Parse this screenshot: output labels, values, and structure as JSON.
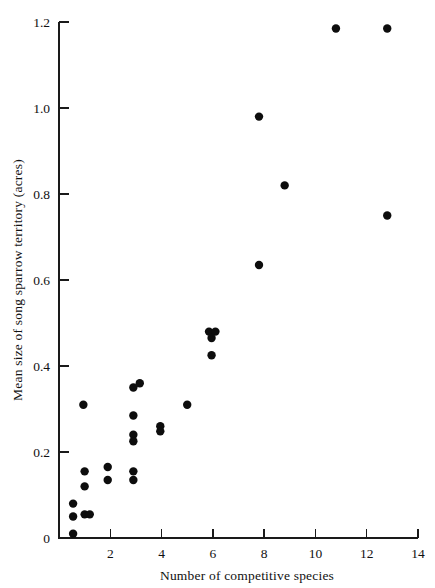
{
  "chart_data": {
    "type": "scatter",
    "title": "",
    "xlabel": "Number of competitive species",
    "ylabel": "Mean size of song sparrow territory  (acres)",
    "xlim": [
      0,
      14
    ],
    "ylim": [
      0,
      1.2
    ],
    "grid": false,
    "legend": "none",
    "xticks": [
      0,
      2,
      4,
      6,
      8,
      10,
      12,
      14
    ],
    "xtick_labels": [
      "",
      "2",
      "4",
      "6",
      "8",
      "10",
      "12",
      "14"
    ],
    "yticks": [
      0,
      0.2,
      0.4,
      0.6,
      0.8,
      1.0,
      1.2
    ],
    "ytick_labels": [
      "0",
      "0.2",
      "0.4",
      "0.6",
      "0.8",
      "1.0",
      "1.2"
    ],
    "marker": "filled-circle",
    "marker_color": "#0d0d0d",
    "marker_size": 4.2,
    "points": [
      {
        "x": 0.55,
        "y": 0.08
      },
      {
        "x": 0.55,
        "y": 0.05
      },
      {
        "x": 0.55,
        "y": 0.01
      },
      {
        "x": 1.0,
        "y": 0.155
      },
      {
        "x": 1.0,
        "y": 0.12
      },
      {
        "x": 1.0,
        "y": 0.055
      },
      {
        "x": 1.2,
        "y": 0.055
      },
      {
        "x": 0.95,
        "y": 0.31
      },
      {
        "x": 1.9,
        "y": 0.165
      },
      {
        "x": 1.9,
        "y": 0.135
      },
      {
        "x": 2.9,
        "y": 0.35
      },
      {
        "x": 3.15,
        "y": 0.36
      },
      {
        "x": 2.9,
        "y": 0.285
      },
      {
        "x": 2.9,
        "y": 0.24
      },
      {
        "x": 2.9,
        "y": 0.225
      },
      {
        "x": 2.9,
        "y": 0.155
      },
      {
        "x": 2.9,
        "y": 0.135
      },
      {
        "x": 3.95,
        "y": 0.26
      },
      {
        "x": 3.95,
        "y": 0.248
      },
      {
        "x": 5.0,
        "y": 0.31
      },
      {
        "x": 5.85,
        "y": 0.48
      },
      {
        "x": 6.1,
        "y": 0.48
      },
      {
        "x": 5.95,
        "y": 0.465
      },
      {
        "x": 5.95,
        "y": 0.425
      },
      {
        "x": 7.8,
        "y": 0.98
      },
      {
        "x": 7.8,
        "y": 0.635
      },
      {
        "x": 8.8,
        "y": 0.82
      },
      {
        "x": 10.8,
        "y": 1.185
      },
      {
        "x": 12.8,
        "y": 1.185
      },
      {
        "x": 12.8,
        "y": 0.75
      }
    ]
  }
}
